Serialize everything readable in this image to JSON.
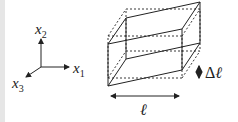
{
  "figure": {
    "type": "shear deformation schematic",
    "axes": {
      "x1": {
        "base": "x",
        "sub": "1"
      },
      "x2": {
        "base": "x",
        "sub": "2"
      },
      "x3": {
        "base": "x",
        "sub": "3"
      }
    },
    "dimensions": {
      "length_label": "ℓ",
      "delta_label": "Δℓ",
      "delta_symbol": "Δ",
      "ell_symbol": "ℓ"
    },
    "legend": {
      "solid": "deformed (sheared) block",
      "dashed": "undeformed block"
    },
    "colors": {
      "line": "#222222",
      "strip": "#e6e6e6"
    }
  }
}
